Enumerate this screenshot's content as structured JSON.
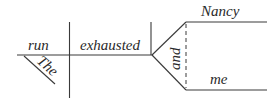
{
  "diagram": {
    "type": "sentence-diagram",
    "sentence_parts": {
      "verb": "run",
      "verb_modifier": "The",
      "complement": "exhausted",
      "conjunction": "and",
      "compound_objects": [
        "Nancy",
        "me"
      ]
    },
    "colors": {
      "line": "#3a3a3a",
      "text": "#2a2a2a",
      "background": "#ffffff"
    }
  }
}
